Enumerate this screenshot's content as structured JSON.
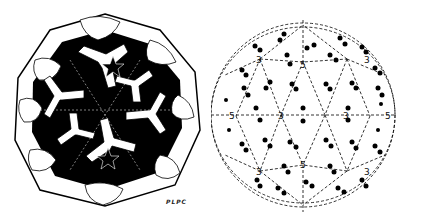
{
  "figure": {
    "type": "virus capsid structure illustration",
    "left_panel": {
      "description": "Hand-drawn icosahedral virus capsid showing protein subunits arranged around 5-fold and 3-fold axes",
      "signature": "PLPC"
    },
    "right_panel": {
      "description": "Icosahedral symmetry schematic (dashed lattice within circle) with subunit pairs",
      "axis_labels": {
        "five_fold": "5",
        "three_fold": "3"
      },
      "five_fold_positions": [
        [
          303,
          62
        ],
        [
          236,
          116
        ],
        [
          370,
          116
        ],
        [
          303,
          165
        ]
      ],
      "three_fold_positions": [
        [
          260,
          59
        ],
        [
          347,
          59
        ],
        [
          281,
          115
        ],
        [
          325,
          115
        ],
        [
          260,
          171
        ],
        [
          347,
          171
        ]
      ]
    },
    "colors": {
      "ink": "#000000",
      "background": "#ffffff"
    }
  }
}
